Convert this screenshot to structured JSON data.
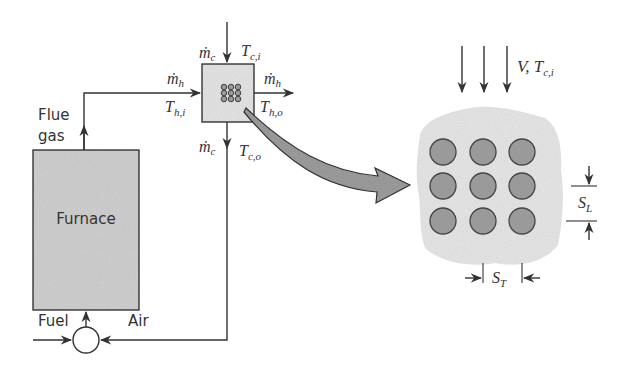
{
  "labels": {
    "flue_gas_1": "Flue",
    "flue_gas_2": "gas",
    "furnace": "Furnace",
    "fuel": "Fuel",
    "air": "Air",
    "mc_in": "ṁ",
    "mc_in_sub": "c",
    "tci": "T",
    "tci_sub": "c,i",
    "mh_in": "ṁ",
    "mh_in_sub": "h",
    "thi": "T",
    "thi_sub": "h,i",
    "mh_out": "ṁ",
    "mh_out_sub": "h",
    "tho": "T",
    "tho_sub": "h,o",
    "mc_out": "ṁ",
    "mc_out_sub": "c",
    "tco": "T",
    "tco_sub": "c,o",
    "v_tci": "V, T",
    "v_tci_sub": "c,i",
    "sl": "S",
    "sl_sub": "L",
    "st": "S",
    "st_sub": "T"
  },
  "colors": {
    "line": "#333333",
    "furnace_fill": "#cfcfcf",
    "hx_fill": "#e4e4e4",
    "tube_fill": "#9a9a9a",
    "cloud_fill": "#e6e6e6",
    "arrow_fill": "#9c9c9c"
  }
}
